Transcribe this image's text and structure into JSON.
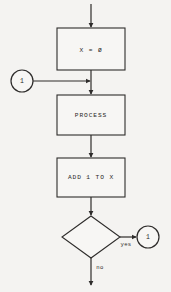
{
  "diagram": {
    "background_color": "#f4f3f1",
    "ink_color": "#2e2c2b"
  },
  "nodes": {
    "init_box": {
      "label": "X = Ø",
      "shape": "rectangle"
    },
    "process_box": {
      "label": "PROCESS",
      "shape": "rectangle"
    },
    "increment_box": {
      "label": "ADD 1 TO X",
      "shape": "rectangle"
    },
    "decision_diamond": {
      "label": "",
      "shape": "diamond"
    },
    "connector_left": {
      "label": "1",
      "shape": "circle"
    },
    "connector_right": {
      "label": "1",
      "shape": "circle"
    }
  },
  "edges": {
    "entry_arrow": {
      "label": ""
    },
    "init_to_process": {
      "label": ""
    },
    "connector_left_join": {
      "label": ""
    },
    "process_to_increment": {
      "label": ""
    },
    "increment_to_decision": {
      "label": ""
    },
    "decision_yes": {
      "label": "yes"
    },
    "decision_no": {
      "label": "no"
    }
  }
}
